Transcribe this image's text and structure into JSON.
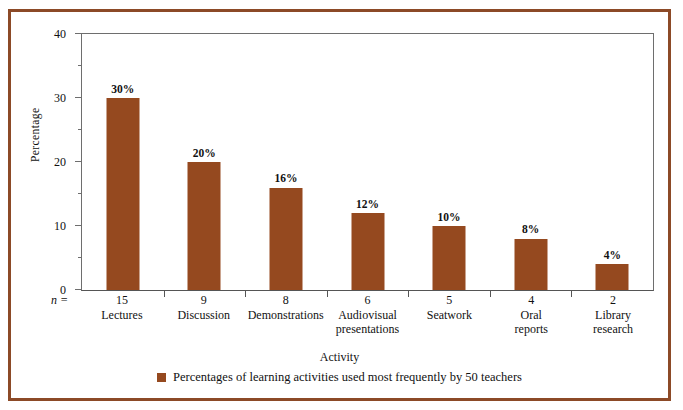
{
  "figure": {
    "bleed_text": "",
    "border_color": "#8c4a27",
    "bar_color": "#95491f",
    "axis_color": "#6e6e6e"
  },
  "axes": {
    "y_title": "Percentage",
    "x_title": "Activity",
    "n_marker": "n ="
  },
  "legend": {
    "marker": "square-marker",
    "text": "Percentages of learning activities used most frequently by 50 teachers"
  },
  "chart_data": {
    "type": "bar",
    "title": "",
    "xlabel": "Activity",
    "ylabel": "Percentage",
    "ylim": [
      0,
      40
    ],
    "yticks": [
      0,
      10,
      20,
      30,
      40
    ],
    "yminorticks": [
      5,
      15,
      25,
      35
    ],
    "grid": false,
    "legend_position": "bottom-center",
    "categories": [
      "Lectures",
      "Discussion",
      "Demonstrations",
      "Audiovisual presentations",
      "Seatwork",
      "Oral reports",
      "Library research"
    ],
    "category_lines": [
      [
        "Lectures"
      ],
      [
        "Discussion"
      ],
      [
        "Demonstrations"
      ],
      [
        "Audiovisual",
        "presentations"
      ],
      [
        "Seatwork"
      ],
      [
        "Oral",
        "reports"
      ],
      [
        "Library",
        "research"
      ]
    ],
    "values": [
      30,
      20,
      16,
      12,
      10,
      8,
      4
    ],
    "value_labels": [
      "30%",
      "20%",
      "16%",
      "12%",
      "10%",
      "8%",
      "4%"
    ],
    "n_values": [
      15,
      9,
      8,
      6,
      5,
      4,
      2
    ],
    "series": [
      {
        "name": "Percentages of learning activities used most frequently by 50 teachers",
        "color": "#95491f",
        "values": [
          30,
          20,
          16,
          12,
          10,
          8,
          4
        ]
      }
    ]
  }
}
